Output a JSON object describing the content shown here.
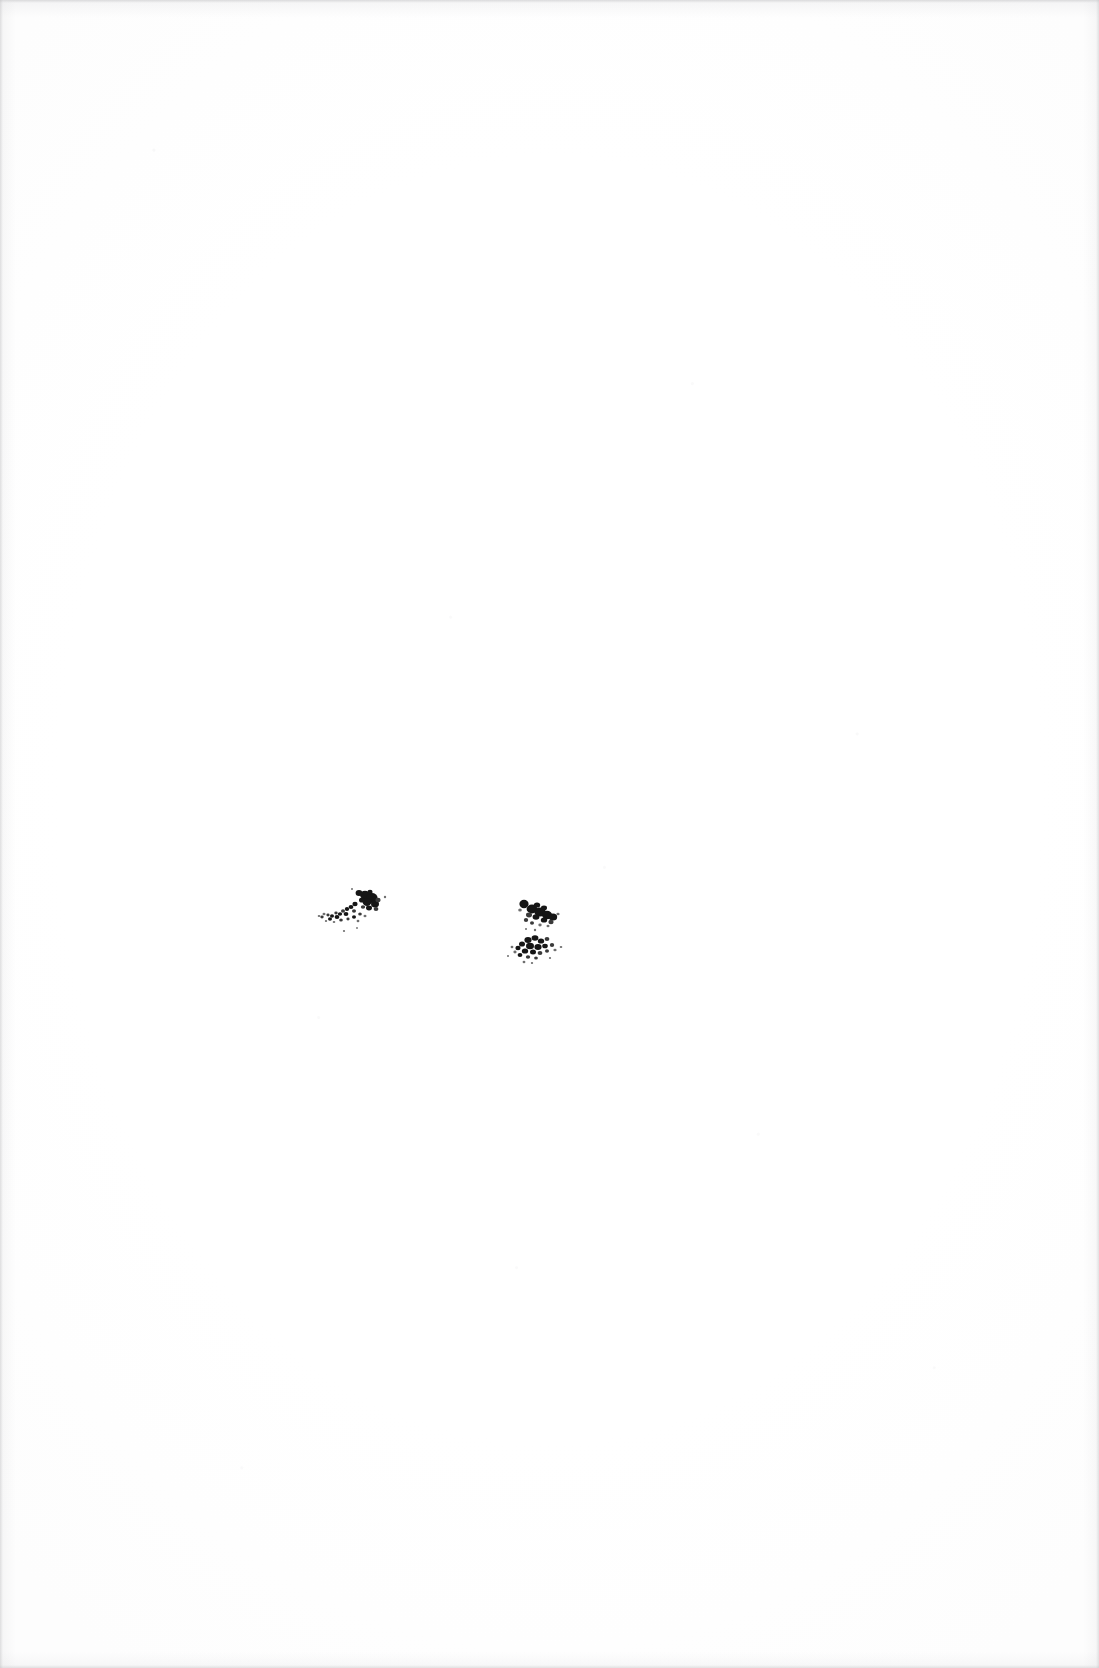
{
  "document": {
    "type": "scanned-page",
    "page_label": "",
    "orientation": "portrait",
    "width_px": 1099,
    "height_px": 1668,
    "background_color": "#ffffff",
    "ink_color": "#151515",
    "edge_shadow_color": "#c4c4c6",
    "text_content": "",
    "note": ""
  },
  "marks": [
    {
      "id": "mark-left",
      "name": "ink-speckle-left",
      "description": "comma-shaped spray of dark toner specks rising to the right",
      "x": 316,
      "y": 886,
      "width": 70,
      "height": 44,
      "color": "#151515"
    },
    {
      "id": "mark-right",
      "name": "ink-speckle-right",
      "description": "two stacked clusters of dark toner specks",
      "x": 488,
      "y": 896,
      "width": 78,
      "height": 68,
      "color": "#151515"
    }
  ]
}
